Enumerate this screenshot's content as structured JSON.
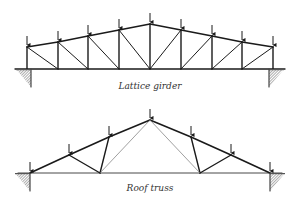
{
  "captions": {
    "lattice": "Lattice girder",
    "roof": "Roof truss"
  },
  "colors": {
    "member": "#1a1a1a",
    "thin_member": "#777777",
    "hatch": "#888888",
    "background": "#ffffff"
  },
  "lattice_girder": {
    "bottom_chord_y": 69,
    "nodes_x": [
      27,
      58,
      88,
      119,
      150,
      181,
      212,
      242,
      273
    ],
    "top_y": [
      47,
      42,
      36,
      30,
      24,
      30,
      36,
      42,
      47
    ],
    "load_arrows": 9,
    "supports": [
      "left",
      "right"
    ]
  },
  "roof_truss": {
    "bottom_chord_y": 173,
    "left_support": [
      30,
      173
    ],
    "right_support": [
      270,
      173
    ],
    "apex": [
      150,
      120
    ],
    "upper_nodes": [
      [
        69,
        155
      ],
      [
        109,
        137
      ],
      [
        150,
        120
      ],
      [
        191,
        137
      ],
      [
        231,
        155
      ]
    ],
    "lower_nodes": [
      [
        100,
        173
      ],
      [
        200,
        173
      ]
    ],
    "load_arrows": 7
  }
}
